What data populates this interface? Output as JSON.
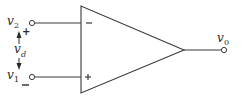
{
  "diagram": {
    "type": "op-amp-symbol",
    "inputs": [
      {
        "name": "inverting",
        "label": "v",
        "subscript": "2",
        "sign": "−",
        "terminal_polarity": "+"
      },
      {
        "name": "non-inverting",
        "label": "v",
        "subscript": "1",
        "sign": "+",
        "terminal_polarity": "−"
      }
    ],
    "differential": {
      "label": "v",
      "subscript": "d"
    },
    "output": {
      "label": "v",
      "subscript": "0"
    },
    "colors": {
      "stroke": "#3a3a3a",
      "text": "#2a2a2a",
      "background": "#ffffff"
    }
  }
}
